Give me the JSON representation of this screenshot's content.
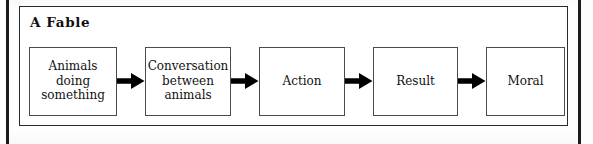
{
  "figure": {
    "title": "A Fable",
    "frame_color": "#2a2a2a",
    "node_border_color": "#4a4a4a",
    "arrow_color": "#000000",
    "background": "#ffffff",
    "page_rule_color": "#1b1b1b"
  },
  "flow": {
    "type": "linear-flowchart",
    "direction": "left-to-right",
    "nodes": [
      {
        "id": "node-1",
        "label": "Animals\ndoing\nsomething",
        "lines": [
          "Animals",
          "doing",
          "something"
        ]
      },
      {
        "id": "node-2",
        "label": "Conversation\nbetween\nanimals",
        "lines": [
          "Conversation",
          "between",
          "animals"
        ]
      },
      {
        "id": "node-3",
        "label": "Action",
        "lines": [
          "Action"
        ]
      },
      {
        "id": "node-4",
        "label": "Result",
        "lines": [
          "Result"
        ]
      },
      {
        "id": "node-5",
        "label": "Moral",
        "lines": [
          "Moral"
        ]
      }
    ],
    "connectors": [
      {
        "from": "node-1",
        "to": "node-2",
        "glyph": "arrow-right"
      },
      {
        "from": "node-2",
        "to": "node-3",
        "glyph": "arrow-right"
      },
      {
        "from": "node-3",
        "to": "node-4",
        "glyph": "arrow-right"
      },
      {
        "from": "node-4",
        "to": "node-5",
        "glyph": "arrow-right"
      }
    ]
  }
}
